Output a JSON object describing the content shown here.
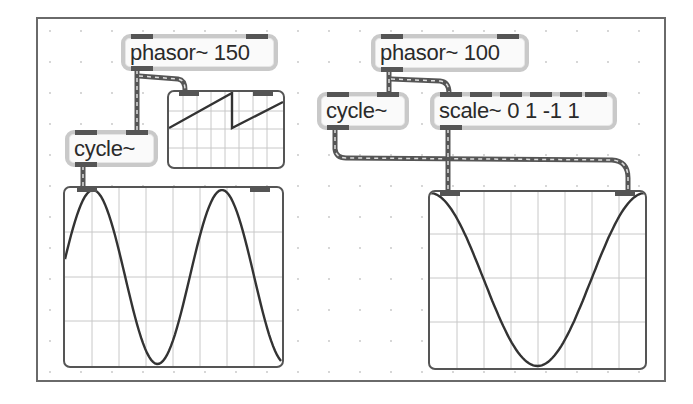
{
  "patcher": {
    "objects": [
      {
        "id": "phasor150",
        "text": "phasor~ 150"
      },
      {
        "id": "cycle_left",
        "text": "cycle~"
      },
      {
        "id": "phasor100",
        "text": "phasor~ 100"
      },
      {
        "id": "cycle_right",
        "text": "cycle~"
      },
      {
        "id": "scale",
        "text": "scale~ 0 1 -1 1"
      }
    ],
    "scopes": [
      {
        "id": "scope_sawtooth",
        "waveform": "sawtooth",
        "source": "phasor~ 150"
      },
      {
        "id": "scope_sine",
        "waveform": "sine",
        "source": "cycle~"
      },
      {
        "id": "scope_xy",
        "waveform": "xy-parabola",
        "source": "cycle~ / scale~ 0 1 -1 1"
      }
    ],
    "colors": {
      "frame": "#6a6a6a",
      "object_border": "#c9c9c9",
      "port": "#555555",
      "patchcord": "#555555",
      "grid": "#c8c8c8",
      "trace": "#333333"
    }
  }
}
